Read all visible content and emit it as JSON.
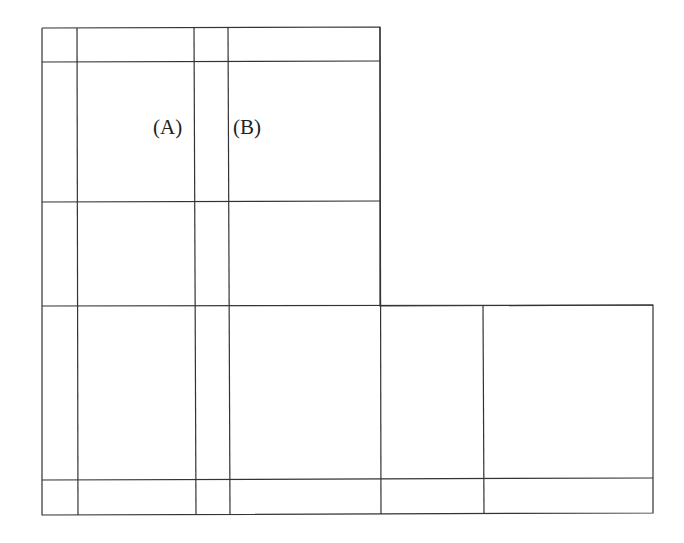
{
  "diagram": {
    "line_color": "#333333",
    "labels": [
      {
        "id": "A",
        "text": "(A)",
        "x": 153,
        "y": 117
      },
      {
        "id": "B",
        "text": "(B)",
        "x": 233,
        "y": 117
      }
    ],
    "grid": {
      "upper_columns_x": [
        42,
        77,
        194,
        228,
        380
      ],
      "lower_columns_x": [
        42,
        77,
        194,
        228,
        380,
        483,
        653
      ],
      "upper_rows_y": [
        28,
        62,
        202,
        306
      ],
      "lower_rows_y": [
        306,
        479,
        514
      ]
    }
  }
}
